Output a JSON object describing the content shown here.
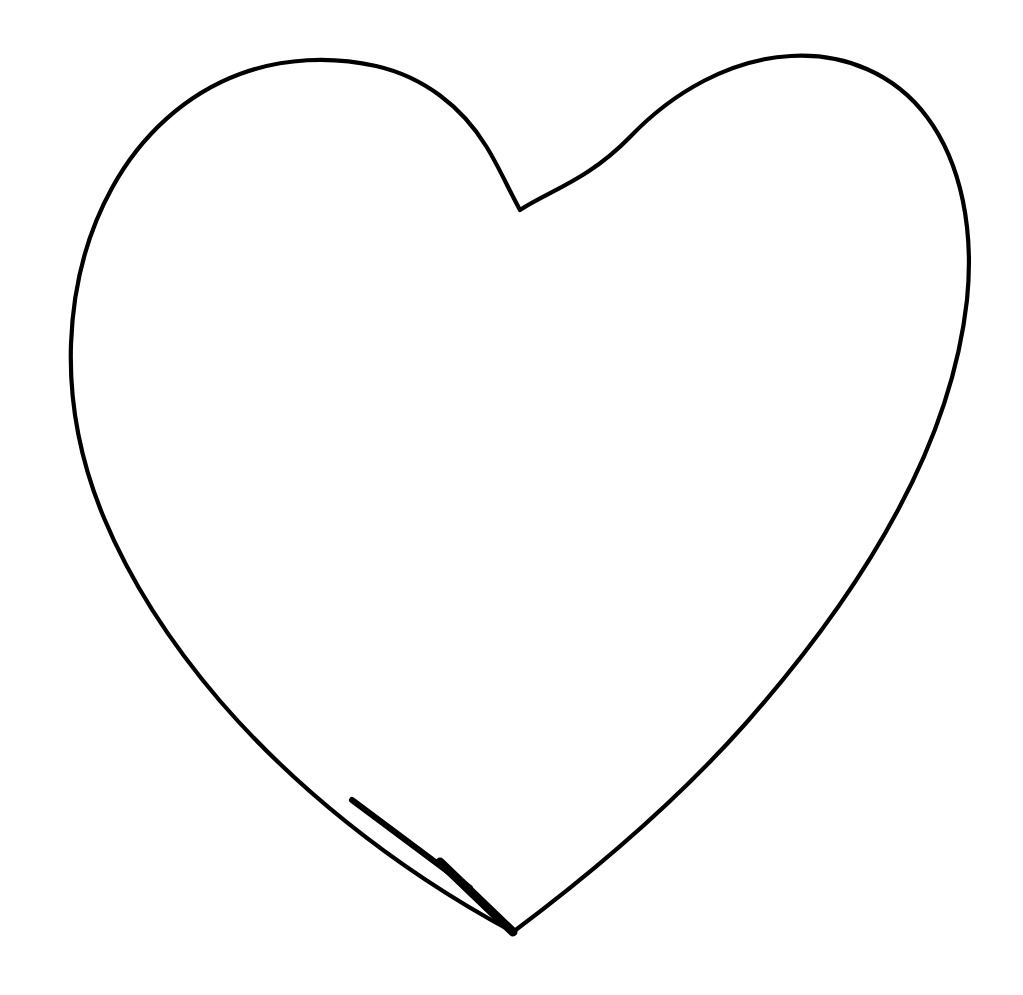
{
  "document": {
    "title": "Heart Outline Drawing",
    "type": "line-drawing",
    "width": 1023,
    "height": 995
  },
  "canvas": {
    "background_color": "#ffffff",
    "name": "drawing-canvas"
  },
  "drawing": {
    "subject": "heart",
    "style": "hand-drawn ink outline",
    "stroke_color": "#000000",
    "fill_color": "#ffffff",
    "stroke_width": 4.2,
    "thick_stroke_width": 9,
    "outline_path": "M 520 210 C 508 188 498 165 486 146 C 462 107 424 77 376 66 C 331 56 283 58 240 74 C 186 94 141 135 112 188 C 86 235 73 289 71 344 C 69 404 81 463 104 518 C 132 585 173 646 220 701 C 290 782 390 866 513 932 C 604 864 685 792 747 722 C 806 655 858 585 898 510 C 934 443 959 372 967 300 C 974 231 962 164 927 117 C 895 74 845 53 791 56 C 731 59 673 92 630 137 C 588 180 551 190 520 210 Z",
    "tip_accent_path": "M 440 862 L 513 932",
    "tip_accent_width": 9,
    "lower_left_accent_path": "M 352 800 L 470 888",
    "lower_left_accent_width": 6,
    "anchor_points": {
      "cleft": [
        520,
        210
      ],
      "left_lobe_top": [
        290,
        63
      ],
      "leftmost": [
        71,
        344
      ],
      "bottom_tip": [
        513,
        932
      ],
      "rightmost": [
        968,
        340
      ],
      "right_lobe_top": [
        755,
        62
      ]
    }
  }
}
